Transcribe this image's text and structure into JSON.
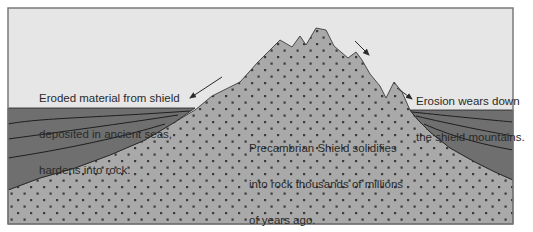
{
  "diagram": {
    "type": "geology-cross-section",
    "colors": {
      "sky": "#e6e6e6",
      "shield": "#a9a9a9",
      "shield_dots": "#3b3b3b",
      "sediment": "#6f6f6f",
      "strata_lines": "#1e1e1e",
      "frame": "#7a7a7a",
      "text": "#2a2a2a"
    },
    "labels": {
      "sediment_label": {
        "lines": [
          "Eroded material from shield",
          "deposited in ancient seas,",
          "hardens into rock."
        ]
      },
      "erosion_label": {
        "lines": [
          "Erosion wears down",
          "the shield mountains."
        ]
      },
      "shield_label": {
        "lines": [
          "Precambrian Shield solidifies",
          "into rock thousands of millions",
          "of years ago."
        ]
      }
    },
    "arrows": [
      {
        "name": "erosion-arrow-left-slope",
        "direction": "down-left"
      },
      {
        "name": "erosion-arrow-upper-right",
        "direction": "down-right"
      },
      {
        "name": "erosion-arrow-lower-right",
        "direction": "down-right"
      }
    ]
  }
}
